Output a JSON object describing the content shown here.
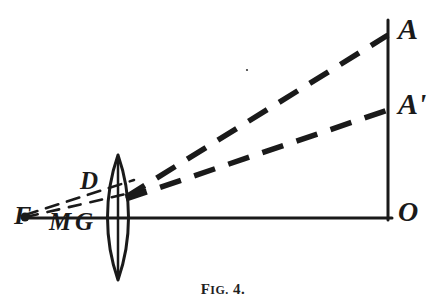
{
  "figure": {
    "caption_prefix": "F",
    "caption_small": "IG.",
    "caption_number": "4.",
    "caption_full": "FIG. 4.",
    "background_color": "#ffffff",
    "ink_color": "#1a1a1a",
    "width": 446,
    "height": 308
  },
  "labels": {
    "A": {
      "text": "A",
      "x": 398,
      "y": 14
    },
    "Ap": {
      "text": "A'",
      "x": 398,
      "y": 89
    },
    "O": {
      "text": "O",
      "x": 398,
      "y": 198
    },
    "D": {
      "text": "D",
      "x": 80,
      "y": 168
    },
    "F": {
      "text": "F",
      "x": 14,
      "y": 203
    },
    "M": {
      "text": "M",
      "x": 49,
      "y": 209
    },
    "G": {
      "text": "G",
      "x": 75,
      "y": 209
    }
  },
  "geometry": {
    "optical_axis": {
      "x1": 23,
      "y1": 218,
      "x2": 392,
      "y2": 218
    },
    "image_plane": {
      "x1": 388,
      "y1": 20,
      "x2": 388,
      "y2": 220
    },
    "lens": {
      "center_x": 118,
      "top_y": 155,
      "bottom_y": 280,
      "half_width": 14,
      "axis_line": {
        "x1": 118,
        "y1": 157,
        "x2": 118,
        "y2": 278
      }
    },
    "ray_upper": {
      "x1": 128,
      "y1": 196,
      "x2": 388,
      "y2": 35,
      "style": "dashed-thick"
    },
    "ray_lower": {
      "x1": 128,
      "y1": 198,
      "x2": 388,
      "y2": 110,
      "style": "dashed-thick"
    },
    "ray_object_upper": {
      "x1": 25,
      "y1": 216,
      "x2": 132,
      "y2": 182,
      "style": "dashed-thin"
    },
    "ray_object_lower": {
      "x1": 25,
      "y1": 217,
      "x2": 148,
      "y2": 190,
      "style": "dashed-thin"
    },
    "point_F": {
      "x": 25,
      "y": 217,
      "r": 4
    }
  }
}
